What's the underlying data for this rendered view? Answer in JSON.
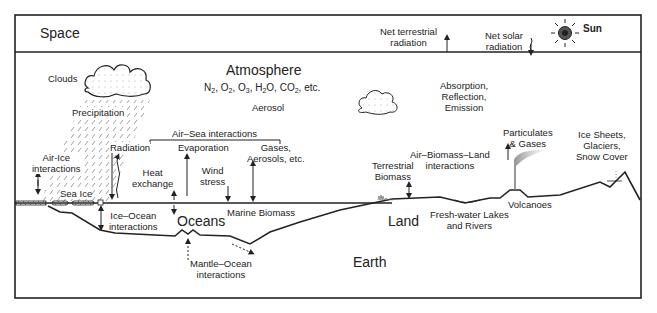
{
  "diagram": {
    "regions": {
      "space": "Space",
      "atmosphere": "Atmosphere",
      "atmosphere_gases": "N2, O2, O3, H2O, CO2, etc.",
      "atmosphere_gases_parts": [
        "N",
        "2",
        ", O",
        "2",
        ", O",
        "3",
        ", H",
        "2",
        "O, CO",
        "2",
        ", etc."
      ],
      "aerosol": "Aerosol",
      "oceans": "Oceans",
      "land": "Land",
      "earth": "Earth"
    },
    "space_labels": {
      "net_terrestrial_1": "Net terrestrial",
      "net_terrestrial_2": "radiation",
      "net_solar_1": "Net solar",
      "net_solar_2": "radiation",
      "sun": "Sun"
    },
    "atmosphere_labels": {
      "clouds": "Clouds",
      "precipitation": "Precipitation",
      "absorption_1": "Absorption,",
      "absorption_2": "Reflection,",
      "absorption_3": "Emission"
    },
    "interaction_labels": {
      "air_ice_1": "Air-Ice",
      "air_ice_2": "interactions",
      "sea_ice": "Sea Ice",
      "radiation": "Radiation",
      "heat_1": "Heat",
      "heat_2": "exchange",
      "air_sea": "Air–Sea interactions",
      "evaporation": "Evaporation",
      "wind_1": "Wind",
      "wind_2": "stress",
      "gases_1": "Gases,",
      "gases_2": "Aerosols, etc.",
      "ice_ocean_1": "Ice–Ocean",
      "ice_ocean_2": "interactions",
      "marine_biomass": "Marine Biomass",
      "mantle_ocean_1": "Mantle–Ocean",
      "mantle_ocean_2": "interactions",
      "terrestrial_biomass_1": "Terrestrial",
      "terrestrial_biomass_2": "Biomass",
      "air_biomass_1": "Air–Biomass–Land",
      "air_biomass_2": "interactions",
      "particulates_1": "Particulates",
      "particulates_2": "& Gases",
      "volcanoes": "Volcanoes",
      "freshwater_1": "Fresh-water Lakes",
      "freshwater_2": "and Rivers",
      "ice_sheets_1": "Ice Sheets,",
      "ice_sheets_2": "Glaciers,",
      "ice_sheets_3": "Snow Cover"
    },
    "colors": {
      "line": "#1a1a1a",
      "background": "#ffffff",
      "hatch": "#777777"
    }
  }
}
